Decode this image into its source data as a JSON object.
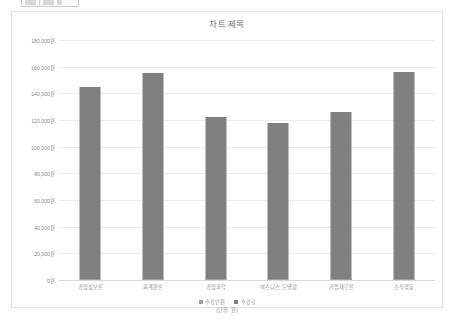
{
  "toolbar": {
    "icons": [
      "toolbar-icon-1",
      "toolbar-separator",
      "toolbar-icon-2",
      "toolbar-icon-3"
    ]
  },
  "chart_data": {
    "type": "bar",
    "title": "차트 제목",
    "xlabel": "",
    "ylabel": "",
    "unit_caption": "(단위: 원)",
    "categories": [
      "경영정보론",
      "회계원론",
      "경영과학",
      "비즈니스 모델링",
      "기업재무론",
      "조직행동"
    ],
    "series": [
      {
        "name": "수강인원",
        "values": [
          0,
          0,
          0,
          0,
          0,
          0
        ],
        "color": "#9c9c9c"
      },
      {
        "name": "수강료",
        "values": [
          145000,
          155000,
          122000,
          118000,
          126000,
          156000
        ],
        "color": "#808080"
      }
    ],
    "ylim": [
      0,
      180000
    ],
    "ytick_values": [
      0,
      20000,
      40000,
      60000,
      80000,
      100000,
      120000,
      140000,
      160000,
      180000
    ],
    "ytick_labels": [
      "0원",
      "20,000원",
      "40,000원",
      "60,000원",
      "80,000원",
      "100,000원",
      "120,000원",
      "140,000원",
      "160,000원",
      "180,000원"
    ],
    "grid": true,
    "legend_position": "bottom"
  }
}
